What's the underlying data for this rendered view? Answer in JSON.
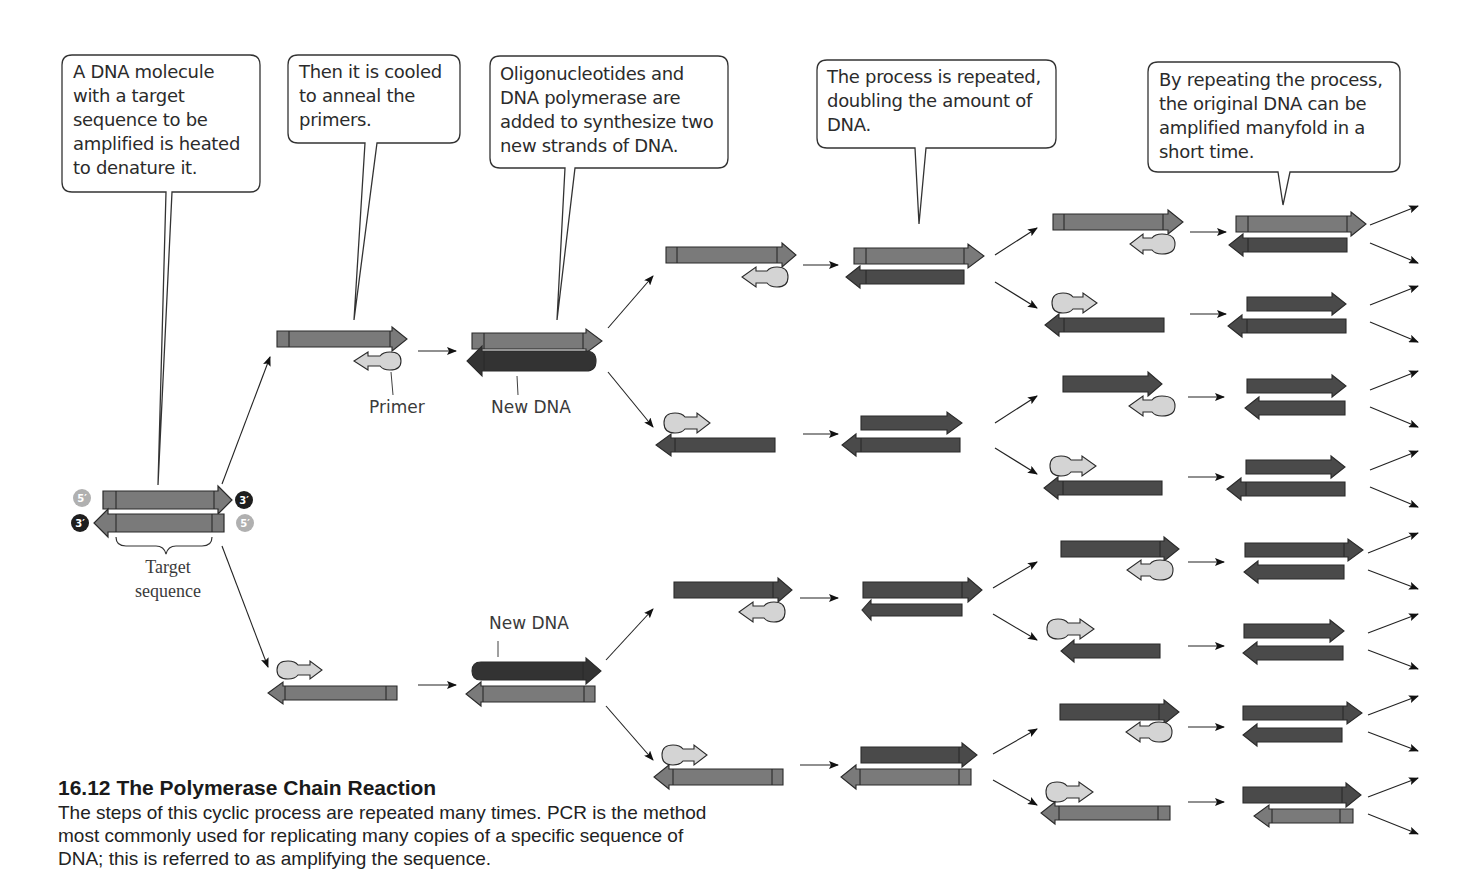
{
  "callouts": [
    {
      "id": "denature",
      "text": "A DNA molecule with a target sequence to be amplified is heated to denature it.",
      "lines": [
        "A DNA molecule",
        "with a target",
        "sequence to be",
        "amplified is heated",
        "to denature it."
      ]
    },
    {
      "id": "anneal",
      "text": "Then it is cooled to anneal the primers.",
      "lines": [
        "Then it is cooled",
        "to anneal the",
        "primers."
      ]
    },
    {
      "id": "synthesize",
      "text": "Oligonucleotides and DNA polymerase are added to synthesize two new strands of DNA.",
      "lines": [
        "Oligonucleotides and",
        "DNA polymerase are",
        "added to synthesize two",
        "new strands of DNA."
      ]
    },
    {
      "id": "repeat",
      "text": "The process is repeated, doubling the amount of DNA.",
      "lines": [
        "The process is repeated,",
        "doubling the amount of",
        "DNA."
      ]
    },
    {
      "id": "amplify",
      "text": "By repeating the process, the original DNA can be amplified manyfold in a short time.",
      "lines": [
        "By repeating the process,",
        "the original DNA can be",
        "amplified manyfold in a",
        "short time."
      ]
    }
  ],
  "labels": {
    "five_prime": "5′",
    "three_prime": "3′",
    "target_sequence": [
      "Target",
      "sequence"
    ],
    "primer": "Primer",
    "new_dna_top": "New DNA",
    "new_dna_bottom": "New DNA"
  },
  "caption": {
    "title": "16.12  The Polymerase Chain Reaction",
    "body_lines": [
      "The steps of this cyclic process are repeated many times. PCR is the method",
      "most commonly used for replicating many copies of a specific sequence of",
      "DNA; this is referred to as amplifying the sequence."
    ]
  },
  "colors": {
    "original_strand": "#7a7a7a",
    "new_strand": "#4a4a4a",
    "new_strand_highlight": "#333333",
    "primer": "#d4d4d4",
    "outline": "#2a2a2a",
    "five_prime_dot": "#b0b0b0",
    "three_prime_dot": "#1e1e1e"
  }
}
